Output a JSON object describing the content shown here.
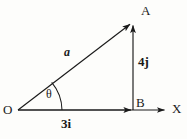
{
  "figure": {
    "background_color": "#fdfdfb",
    "stroke_color": "#1a1a1a"
  },
  "points": {
    "origin": {
      "label": "O",
      "x": 18,
      "y": 110
    },
    "tip": {
      "label": "A",
      "x": 133,
      "y": 22
    },
    "foot": {
      "label": "B",
      "x": 133,
      "y": 110
    }
  },
  "axes": {
    "x_axis_label": "X",
    "x_axis_end": {
      "x": 170,
      "y": 110
    }
  },
  "vectors": {
    "resultant": {
      "label": "a",
      "from": "O",
      "to": "A"
    },
    "horizontal_component": {
      "label": "3i",
      "magnitude": 3,
      "unit_vector": "i",
      "from": "O",
      "to": "B"
    },
    "vertical_component": {
      "label": "4j",
      "magnitude": 4,
      "unit_vector": "j",
      "from": "B",
      "to": "A"
    }
  },
  "angle": {
    "label": "θ",
    "name": "theta",
    "at_point": "O"
  }
}
